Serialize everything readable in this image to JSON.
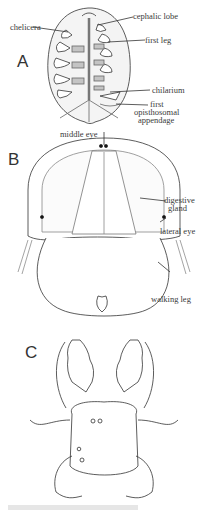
{
  "figure": {
    "panels": [
      {
        "id": "A",
        "letter": "A",
        "labels": {
          "chelicera": "chelicera",
          "cephalic_lobe": "cephalic lobe",
          "first_leg": "first leg",
          "chilarium": "chilarium",
          "first_opisthosomal_1": "first",
          "first_opisthosomal_2": "opisthosomal",
          "first_opisthosomal_3": "appendage"
        }
      },
      {
        "id": "B",
        "letter": "B",
        "labels": {
          "middle_eye": "middle eye",
          "digestive_1": "digestive",
          "digestive_2": "gland",
          "lateral_eye": "lateral eye",
          "walking_leg": "walking leg"
        }
      },
      {
        "id": "C",
        "letter": "C",
        "labels": {}
      }
    ],
    "colors": {
      "line": "#333333",
      "fill_light": "#f2f2f2",
      "fill_gray": "#bdbdbd"
    }
  }
}
